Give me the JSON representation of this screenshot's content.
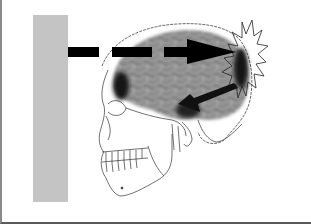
{
  "diagram": {
    "elements": [
      {
        "name": "impact-wall",
        "description": "gray vertical surface"
      },
      {
        "name": "motion-arrow",
        "description": "dashed arrow from wall toward back of skull",
        "style": "dashed"
      },
      {
        "name": "skull",
        "description": "line drawing of skull in profile"
      },
      {
        "name": "brain",
        "description": "gray brain with gyri texture"
      },
      {
        "name": "coup-contusion",
        "description": "dark area at back of brain"
      },
      {
        "name": "contrecoup-contusion",
        "description": "dark area at front of brain"
      },
      {
        "name": "rebound-arrow",
        "description": "solid arrow pointing from back toward front-lower brain"
      },
      {
        "name": "impact-starburst",
        "description": "jagged starburst at point of impact"
      }
    ]
  },
  "colors": {
    "wall": "#c4c4c4",
    "arrow": "#000000",
    "brain": "#8c8c8c",
    "contusion": "#1a1a1a",
    "outline": "#333333",
    "background": "#ffffff"
  }
}
